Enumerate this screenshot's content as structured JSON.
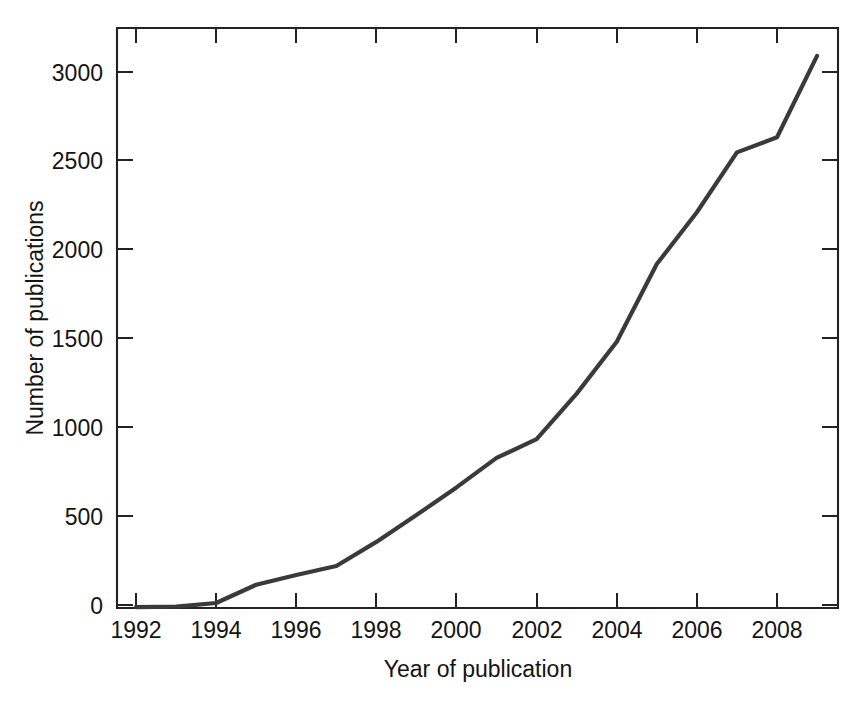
{
  "chart_data": {
    "type": "line",
    "title": "",
    "xlabel": "Year of publication",
    "ylabel": "Number of publications",
    "x": [
      1992,
      1993,
      1994,
      1995,
      1996,
      1997,
      1998,
      1999,
      2000,
      2001,
      2002,
      2003,
      2004,
      2005,
      2006,
      2007,
      2008,
      2009
    ],
    "values": [
      5,
      8,
      28,
      130,
      185,
      235,
      370,
      520,
      675,
      840,
      945,
      1200,
      1490,
      1925,
      2215,
      2550,
      2635,
      3090
    ],
    "series": [
      {
        "name": "Number of publications",
        "values": [
          5,
          8,
          28,
          130,
          185,
          235,
          370,
          520,
          675,
          840,
          945,
          1200,
          1490,
          1925,
          2215,
          2550,
          2635,
          3090
        ]
      }
    ],
    "xlim": [
      1991.5,
      2009.5
    ],
    "ylim": [
      0,
      3250
    ],
    "xticks": [
      1992,
      1994,
      1996,
      1998,
      2000,
      2002,
      2004,
      2006,
      2008
    ],
    "xticklabels": [
      "1992",
      "1994",
      "1996",
      "1998",
      "2000",
      "2002",
      "2004",
      "2006",
      "2008"
    ],
    "yticks": [
      0,
      500,
      1000,
      1500,
      2000,
      2500,
      3000
    ],
    "yticklabels": [
      "0",
      "500",
      "1000",
      "1500",
      "2000",
      "2500",
      "3000"
    ],
    "grid": false,
    "legend": null,
    "line_color": "#3a3a3a",
    "axis_color": "#222222",
    "background": "#ffffff"
  },
  "axes": {
    "y_title": "Number of publications",
    "x_title": "Year of publication",
    "y_tick_labels": [
      "3000",
      "2500",
      "2000",
      "1500",
      "1000",
      "500",
      "0"
    ],
    "x_tick_labels": [
      "1992",
      "1994",
      "1996",
      "1998",
      "2000",
      "2002",
      "2004",
      "2006",
      "2008"
    ]
  }
}
